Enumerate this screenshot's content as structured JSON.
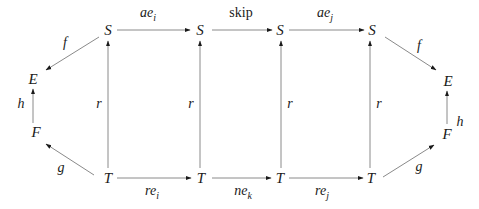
{
  "diagram": {
    "type": "commutative-diagram",
    "nodes": {
      "s1": "S",
      "s2": "S",
      "s3": "S",
      "s4": "S",
      "t1": "T",
      "t2": "T",
      "t3": "T",
      "t4": "T",
      "e_left": "E",
      "f_left": "F",
      "e_right": "E",
      "f_right": "F"
    },
    "edges": {
      "top_1": {
        "base": "ae",
        "sub": "i"
      },
      "top_2": {
        "base": "skip",
        "sub": ""
      },
      "top_3": {
        "base": "ae",
        "sub": "j"
      },
      "bottom_1": {
        "base": "re",
        "sub": "i"
      },
      "bottom_2": {
        "base": "ne",
        "sub": "k"
      },
      "bottom_3": {
        "base": "re",
        "sub": "j"
      },
      "vertical_1": "r",
      "vertical_2": "r",
      "vertical_3": "r",
      "vertical_4": "r",
      "left_f": "f",
      "left_h": "h",
      "left_g": "g",
      "right_f": "f",
      "right_h": "h",
      "right_g": "g"
    }
  }
}
